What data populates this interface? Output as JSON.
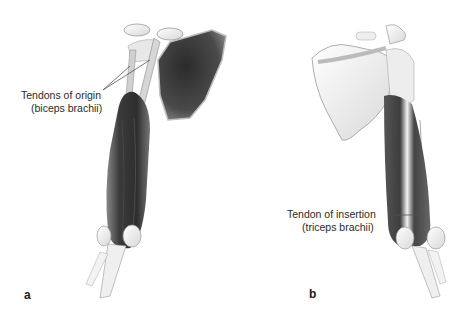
{
  "figure": {
    "panels": [
      {
        "letter": "a",
        "annotation": {
          "line1": "Tendons of origin",
          "line2": "(biceps brachii)"
        }
      },
      {
        "letter": "b",
        "annotation": {
          "line1": "Tendon of insertion",
          "line2": "(triceps brachii)"
        }
      }
    ]
  },
  "colors": {
    "muscle_dark": "#3a3a3a",
    "muscle_mid": "#6b6b6b",
    "bone": "#f4f4f4",
    "bone_outline": "#9a9a9a",
    "leader_line": "#555555",
    "text": "#2a2a2a"
  }
}
